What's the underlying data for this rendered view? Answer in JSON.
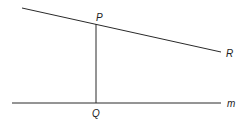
{
  "diagram": {
    "type": "geometry",
    "colors": {
      "line": "#2a2a2a",
      "label": "#222222",
      "background": "#ffffff"
    },
    "lines": [
      {
        "name": "line-PR",
        "x1": 22,
        "y1": 8,
        "x2": 221,
        "y2": 52
      },
      {
        "name": "segment-PQ",
        "x1": 96,
        "y1": 24,
        "x2": 96,
        "y2": 103
      },
      {
        "name": "line-m",
        "x1": 12,
        "y1": 103,
        "x2": 221,
        "y2": 103
      }
    ],
    "labels": {
      "P": "P",
      "Q": "Q",
      "R": "R",
      "m": "m"
    }
  }
}
